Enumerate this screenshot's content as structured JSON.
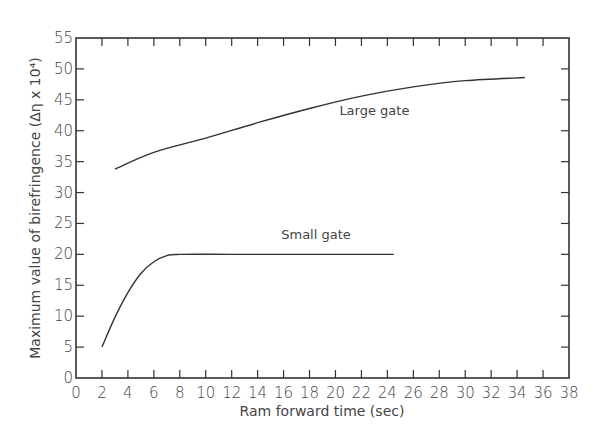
{
  "chart_data": {
    "type": "line",
    "title": "",
    "xlabel": "Ram forward time (sec)",
    "ylabel": "Maximum value of birefringence (Δη x 10⁴)",
    "xlim": [
      0,
      38
    ],
    "ylim": [
      0,
      55
    ],
    "xticks": [
      0,
      2,
      4,
      6,
      8,
      10,
      12,
      14,
      16,
      18,
      20,
      22,
      24,
      26,
      28,
      30,
      32,
      34,
      36,
      38
    ],
    "yticks": [
      0,
      5,
      10,
      15,
      20,
      25,
      30,
      35,
      40,
      45,
      50,
      55
    ],
    "grid": false,
    "legend": "inline labels",
    "series": [
      {
        "name": "Large gate",
        "x": [
          3,
          6,
          10,
          14,
          18,
          22,
          26,
          30,
          34.6
        ],
        "y": [
          33.8,
          36.5,
          38.8,
          41.3,
          43.6,
          45.6,
          47.1,
          48.1,
          48.6
        ],
        "label_pos": [
          23,
          42.5
        ]
      },
      {
        "name": "Small gate",
        "x": [
          2,
          3,
          4,
          5,
          6,
          7,
          8,
          12,
          16,
          20,
          24.5
        ],
        "y": [
          5,
          9.8,
          13.8,
          16.9,
          18.8,
          19.8,
          20,
          20,
          20,
          20,
          20
        ],
        "label_pos": [
          18.5,
          22.5
        ]
      }
    ]
  }
}
